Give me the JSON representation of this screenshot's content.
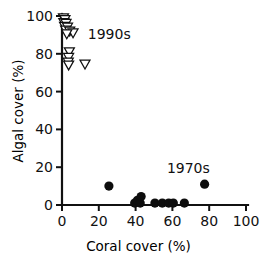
{
  "chart_data": {
    "type": "scatter",
    "title": "",
    "xlabel": "Coral cover (%)",
    "ylabel": "Algal cover (%)",
    "xlim": [
      0,
      100
    ],
    "ylim": [
      0,
      100
    ],
    "xticks": [
      0,
      20,
      40,
      60,
      80,
      100
    ],
    "yticks": [
      0,
      20,
      40,
      60,
      80,
      100
    ],
    "xticklabels": [
      "0",
      "20",
      "40",
      "60",
      "80",
      "100"
    ],
    "yticklabels": [
      "0",
      "20",
      "40",
      "60",
      "80",
      "100"
    ],
    "grid": false,
    "legend_position": "none",
    "annotations": [
      {
        "text": "1990s",
        "x": 14,
        "y": 88
      },
      {
        "text": "1970s",
        "x": 57,
        "y": 17
      }
    ],
    "series": [
      {
        "name": "1970s",
        "marker": "filled-circle",
        "color": "#0d0d0d",
        "points": [
          {
            "x": 25.5,
            "y": 10.0
          },
          {
            "x": 39.5,
            "y": 1.0
          },
          {
            "x": 41.0,
            "y": 2.5
          },
          {
            "x": 42.5,
            "y": 1.0
          },
          {
            "x": 43.0,
            "y": 4.5
          },
          {
            "x": 50.5,
            "y": 1.0
          },
          {
            "x": 54.5,
            "y": 1.0
          },
          {
            "x": 58.0,
            "y": 1.0
          },
          {
            "x": 60.5,
            "y": 1.0
          },
          {
            "x": 66.5,
            "y": 1.0
          },
          {
            "x": 77.5,
            "y": 11.0
          }
        ]
      },
      {
        "name": "1990s",
        "marker": "open-triangle-down",
        "color": "#ffffff",
        "edgecolor": "#111111",
        "points": [
          {
            "x": 0.8,
            "y": 99.0
          },
          {
            "x": 1.6,
            "y": 98.0
          },
          {
            "x": 1.0,
            "y": 96.5
          },
          {
            "x": 2.2,
            "y": 96.0
          },
          {
            "x": 1.4,
            "y": 94.5
          },
          {
            "x": 3.0,
            "y": 94.0
          },
          {
            "x": 2.0,
            "y": 92.5
          },
          {
            "x": 4.2,
            "y": 92.0
          },
          {
            "x": 6.0,
            "y": 91.0
          },
          {
            "x": 2.6,
            "y": 90.5
          },
          {
            "x": 4.0,
            "y": 81.0
          },
          {
            "x": 3.6,
            "y": 78.0
          },
          {
            "x": 3.4,
            "y": 75.5
          },
          {
            "x": 3.6,
            "y": 74.0
          },
          {
            "x": 12.5,
            "y": 74.5
          }
        ]
      }
    ]
  }
}
